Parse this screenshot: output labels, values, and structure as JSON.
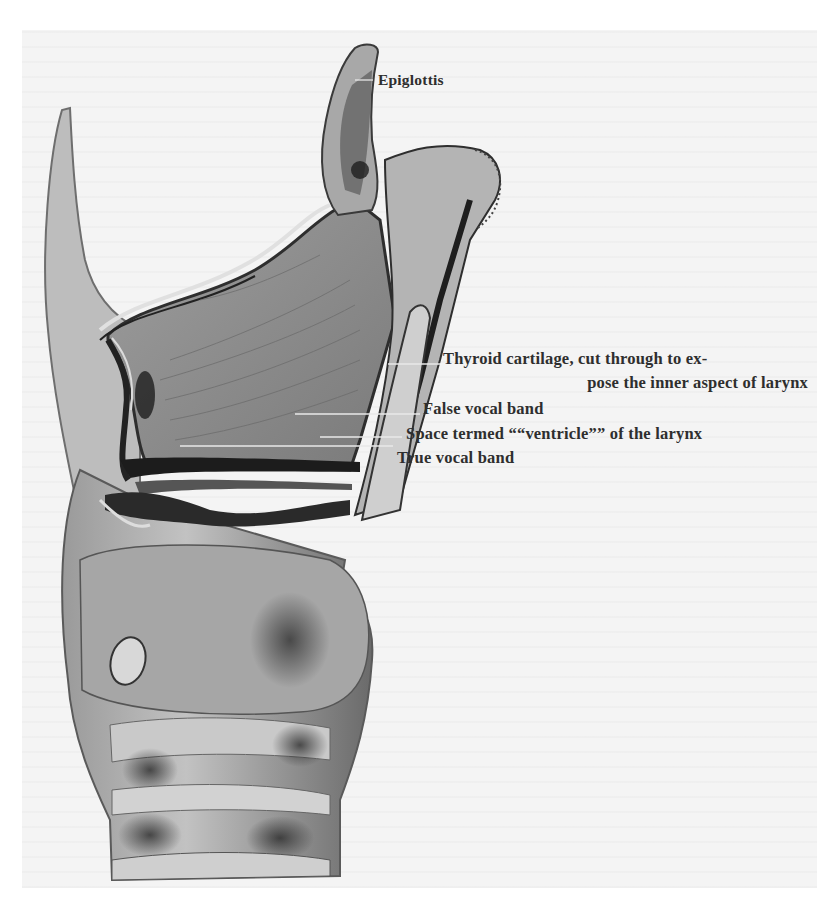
{
  "figure": {
    "colors": {
      "paper": "#f4f4f4",
      "background": "#ffffff",
      "ink": "#2e2e2e",
      "tissue_light": "#b5b5b5",
      "tissue_mid": "#8a8a8a",
      "tissue_dark": "#2a2a2a"
    },
    "labels": {
      "epiglottis": "Epiglottis",
      "thyroid_line1": "Thyroid cartilage, cut through to ex-",
      "thyroid_line2": "pose the inner aspect of larynx",
      "false_vocal_band": "False vocal band",
      "ventricle": "Space termed ““ventricle”” of the larynx",
      "true_vocal_band": "True vocal band"
    }
  }
}
